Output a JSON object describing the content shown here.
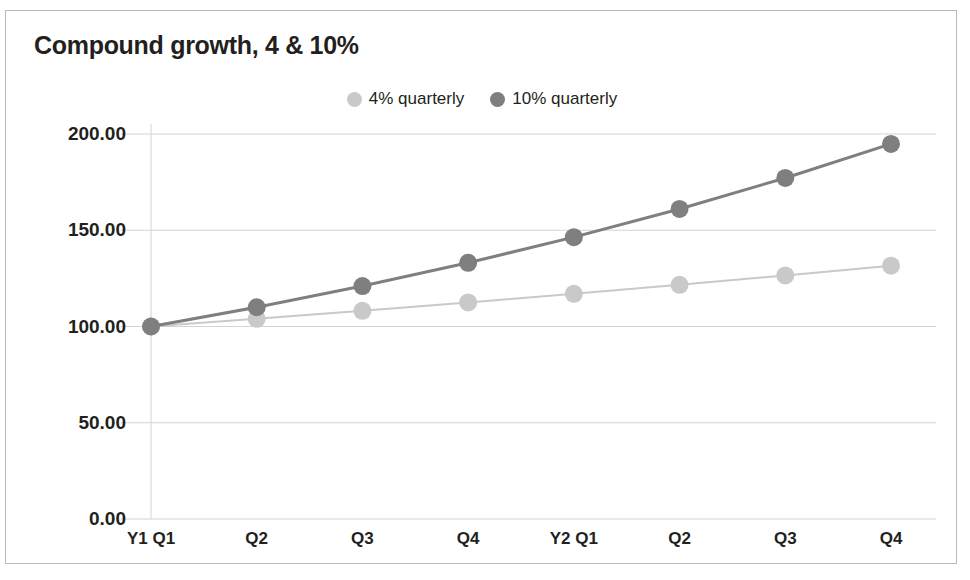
{
  "chart_data": {
    "type": "line",
    "title": "Compound growth, 4 & 10%",
    "xlabel": "",
    "ylabel": "",
    "categories": [
      "Y1 Q1",
      "Q2",
      "Q3",
      "Q4",
      "Y2 Q1",
      "Q2",
      "Q3",
      "Q4"
    ],
    "series": [
      {
        "name": "4% quarterly",
        "color": "#c9c9c9",
        "values": [
          100.0,
          104.0,
          108.16,
          112.49,
          116.99,
          121.67,
          126.53,
          131.59
        ]
      },
      {
        "name": "10% quarterly",
        "color": "#7f7f7f",
        "values": [
          100.0,
          110.0,
          121.0,
          133.1,
          146.41,
          161.05,
          177.16,
          194.87
        ]
      }
    ],
    "ylim": [
      0,
      200
    ],
    "yticks": [
      0,
      50,
      100,
      150,
      200
    ],
    "ytick_labels": [
      "0.00",
      "50.00",
      "100.00",
      "150.00",
      "200.00"
    ],
    "grid": true,
    "legend_position": "top-center"
  },
  "legend": {
    "entries": [
      {
        "label": "4% quarterly",
        "marker": "circle-marker-light"
      },
      {
        "label": "10% quarterly",
        "marker": "circle-marker-dark"
      }
    ]
  },
  "colors": {
    "series_light": "#c9c9c9",
    "series_dark": "#7f7f7f",
    "grid": "#d4d4d4",
    "text": "#231f20",
    "frame_border": "#b9b9b9",
    "background": "#ffffff"
  }
}
